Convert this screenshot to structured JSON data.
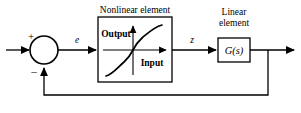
{
  "diagram": {
    "type": "block-diagram",
    "width": 301,
    "height": 113,
    "background_color": "#ffffff",
    "line_color": "#000000"
  },
  "summing_junction": {
    "name": "summing-junction",
    "shape": "circle",
    "center_x": 44,
    "center_y": 50,
    "radius": 14,
    "positive_sign": "+",
    "negative_sign": "–"
  },
  "signals": {
    "error_label": "e",
    "nonlinear_output_label": "z"
  },
  "blocks": [
    {
      "id": "nonlinear-element",
      "caption": "Nonlinear element",
      "caption_lines": [
        "Nonlinear element"
      ],
      "x": 98,
      "y": 17,
      "width": 74,
      "height": 65,
      "inner_axis_x_label": "Input",
      "inner_axis_y_label": "Output",
      "inner_plot_type": "sigmoid-saturation-curve"
    },
    {
      "id": "linear-element",
      "caption": "Linear element",
      "caption_lines": [
        "Linear",
        "element"
      ],
      "x": 218,
      "y": 38,
      "width": 32,
      "height": 24,
      "transfer_function": "G(s)"
    }
  ],
  "wires": {
    "input_wire": "reference input to summing junction",
    "error_wire": "summing junction to nonlinear element",
    "z_wire": "nonlinear element to linear element",
    "output_wire": "linear element to output arrow",
    "feedback_wire": "output tap back to summing junction negative input"
  }
}
